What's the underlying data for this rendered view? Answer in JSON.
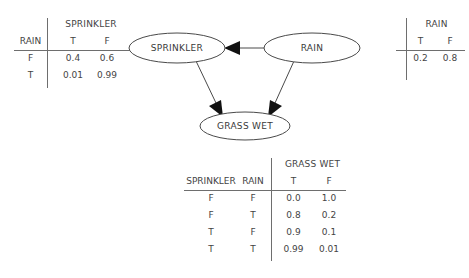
{
  "diagram": {
    "nodes": [
      {
        "id": "sprinkler",
        "label": "SPRINKLER"
      },
      {
        "id": "rain",
        "label": "RAIN"
      },
      {
        "id": "grass_wet",
        "label": "GRASS WET"
      }
    ],
    "edges": [
      {
        "from": "rain",
        "to": "sprinkler"
      },
      {
        "from": "sprinkler",
        "to": "grass_wet"
      },
      {
        "from": "rain",
        "to": "grass_wet"
      }
    ]
  },
  "sprinkler_table": {
    "span_header": "SPRINKLER",
    "condition_header": "RAIN",
    "columns": [
      "T",
      "F"
    ],
    "rows": [
      {
        "rain": "F",
        "t": "0.4",
        "f": "0.6"
      },
      {
        "rain": "T",
        "t": "0.01",
        "f": "0.99"
      }
    ]
  },
  "rain_table": {
    "span_header": "RAIN",
    "columns": [
      "T",
      "F"
    ],
    "rows": [
      {
        "t": "0.2",
        "f": "0.8"
      }
    ]
  },
  "grass_wet_table": {
    "span_header": "GRASS WET",
    "condition_headers": [
      "SPRINKLER",
      "RAIN"
    ],
    "columns": [
      "T",
      "F"
    ],
    "rows": [
      {
        "sprinkler": "F",
        "rain": "F",
        "t": "0.0",
        "f": "1.0"
      },
      {
        "sprinkler": "F",
        "rain": "T",
        "t": "0.8",
        "f": "0.2"
      },
      {
        "sprinkler": "T",
        "rain": "F",
        "t": "0.9",
        "f": "0.1"
      },
      {
        "sprinkler": "T",
        "rain": "T",
        "t": "0.99",
        "f": "0.01"
      }
    ]
  },
  "colors": {
    "background": "#ffffff",
    "text": "#3a3a3a",
    "rule": "#6e6e6e",
    "node_stroke": "#4a4a4a",
    "arrow_fill": "#111111"
  }
}
